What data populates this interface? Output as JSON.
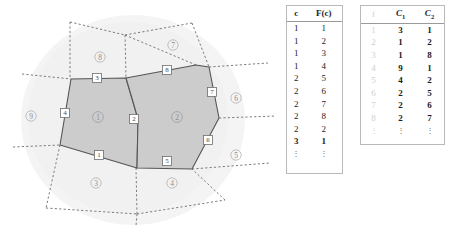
{
  "figure": {
    "name": "voronoi-cells-and-incidence-tables"
  },
  "diagram": {
    "highlighted_cells": [
      {
        "id": "1",
        "label": "1",
        "cx": 98,
        "cy": 117
      },
      {
        "id": "2",
        "label": "2",
        "cx": 177,
        "cy": 117
      }
    ],
    "outer_cells": [
      {
        "id": "8",
        "label": "8",
        "cx": 100,
        "cy": 57
      },
      {
        "id": "7",
        "label": "7",
        "cx": 173,
        "cy": 45
      },
      {
        "id": "6",
        "label": "6",
        "cx": 236,
        "cy": 98
      },
      {
        "id": "5",
        "label": "5",
        "cx": 236,
        "cy": 155
      },
      {
        "id": "4",
        "label": "4",
        "cx": 172,
        "cy": 183
      },
      {
        "id": "3",
        "label": "3",
        "cx": 96,
        "cy": 183
      },
      {
        "id": "9",
        "label": "9",
        "cx": 31,
        "cy": 116
      }
    ],
    "edge_labels": [
      {
        "id": "1",
        "label": "1",
        "cx": 99,
        "cy": 155
      },
      {
        "id": "2",
        "label": "2",
        "cx": 134,
        "cy": 119
      },
      {
        "id": "3",
        "label": "3",
        "cx": 97,
        "cy": 78
      },
      {
        "id": "4",
        "label": "4",
        "cx": 65,
        "cy": 113
      },
      {
        "id": "5",
        "label": "5",
        "cx": 167,
        "cy": 161
      },
      {
        "id": "6",
        "label": "6",
        "cx": 208,
        "cy": 140
      },
      {
        "id": "7",
        "label": "7",
        "cx": 212,
        "cy": 92
      },
      {
        "id": "8",
        "label": "8",
        "cx": 167,
        "cy": 70
      }
    ],
    "colors": {
      "fill_highlight": "#cccccc",
      "stroke_solid": "#555555",
      "stroke_dashed": "#777777",
      "backdrop": "#f4f4f4",
      "label_circle_text": "#8d8d8d",
      "label_square_text": "#4a4a4a"
    }
  },
  "table_cF": {
    "headers": [
      "c",
      "F(c)"
    ],
    "rows": [
      [
        "1",
        "1"
      ],
      [
        "1",
        "2"
      ],
      [
        "1",
        "3"
      ],
      [
        "1",
        "4"
      ],
      [
        "2",
        "5"
      ],
      [
        "2",
        "6"
      ],
      [
        "2",
        "7"
      ],
      [
        "2",
        "8"
      ],
      [
        "2",
        "2"
      ],
      [
        "3",
        "1"
      ]
    ],
    "continuation": [
      "⋮",
      "⋮"
    ],
    "bold_row_index": 9
  },
  "table_fC": {
    "headers": [
      "f",
      "C",
      "C"
    ],
    "header_subs": [
      "",
      "1",
      "2"
    ],
    "rows": [
      [
        "1",
        "3",
        "1"
      ],
      [
        "2",
        "1",
        "2"
      ],
      [
        "3",
        "1",
        "8"
      ],
      [
        "4",
        "9",
        "1"
      ],
      [
        "5",
        "4",
        "2"
      ],
      [
        "6",
        "2",
        "5"
      ],
      [
        "7",
        "2",
        "6"
      ],
      [
        "8",
        "2",
        "7"
      ]
    ],
    "continuation": [
      "⋮",
      "⋮",
      "⋮"
    ]
  }
}
